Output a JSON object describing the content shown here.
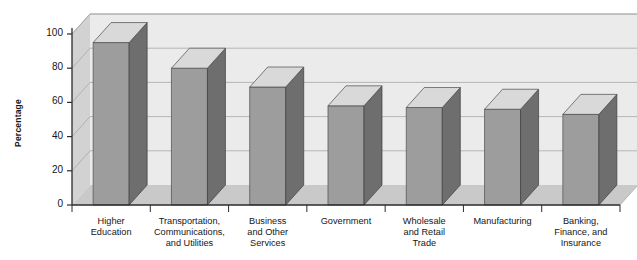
{
  "chart_data": {
    "type": "bar",
    "title": "",
    "xlabel": "",
    "ylabel": "Percentage",
    "ylim": [
      0,
      100
    ],
    "yticks": [
      0,
      20,
      40,
      60,
      80,
      100
    ],
    "grid": true,
    "legend": "none",
    "style": "3d-bar",
    "categories": [
      "Higher Education",
      "Transportation, Communications, and Utilities",
      "Business and Other Services",
      "Government",
      "Wholesale and Retail Trade",
      "Manufacturing",
      "Banking, Finance, and Insurance"
    ],
    "category_lines": [
      [
        "Higher",
        "Education"
      ],
      [
        "Transportation,",
        "Communications,",
        "and Utilities"
      ],
      [
        "Business",
        "and Other",
        "Services"
      ],
      [
        "Government"
      ],
      [
        "Wholesale",
        "and Retail",
        "Trade"
      ],
      [
        "Manufacturing"
      ],
      [
        "Banking,",
        "Finance, and",
        "Insurance"
      ]
    ],
    "values": [
      95,
      80,
      69,
      58,
      57,
      56,
      53
    ]
  },
  "colors": {
    "bar_front": "#9d9d9d",
    "bar_side": "#6e6e6e",
    "bar_top": "#d9d9d9",
    "wall_back": "#ebebeb",
    "wall_left": "#d2d2d2",
    "floor": "#c9c9c9",
    "gridline": "#a8a8a8",
    "axis": "#2b2b2b",
    "background": "#ffffff",
    "text": "#161616"
  }
}
